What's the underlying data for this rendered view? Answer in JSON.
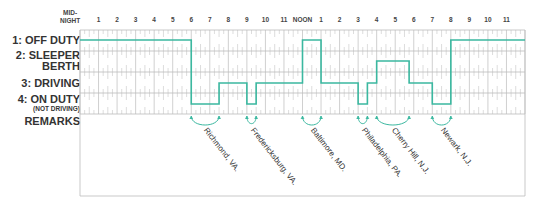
{
  "header": {
    "midnight_label": [
      "MID-",
      "NIGHT"
    ],
    "hour_labels": [
      {
        "hour": 1,
        "label": "1"
      },
      {
        "hour": 2,
        "label": "2"
      },
      {
        "hour": 3,
        "label": "3"
      },
      {
        "hour": 4,
        "label": "4"
      },
      {
        "hour": 5,
        "label": "5"
      },
      {
        "hour": 6,
        "label": "6"
      },
      {
        "hour": 7,
        "label": "7"
      },
      {
        "hour": 8,
        "label": "8"
      },
      {
        "hour": 9,
        "label": "9"
      },
      {
        "hour": 10,
        "label": "10"
      },
      {
        "hour": 11,
        "label": "11"
      },
      {
        "hour": 12,
        "label": "NOON"
      },
      {
        "hour": 13,
        "label": "1"
      },
      {
        "hour": 14,
        "label": "2"
      },
      {
        "hour": 15,
        "label": "3"
      },
      {
        "hour": 16,
        "label": "4"
      },
      {
        "hour": 17,
        "label": "5"
      },
      {
        "hour": 18,
        "label": "6"
      },
      {
        "hour": 19,
        "label": "7"
      },
      {
        "hour": 20,
        "label": "8"
      },
      {
        "hour": 21,
        "label": "9"
      },
      {
        "hour": 22,
        "label": "10"
      },
      {
        "hour": 23,
        "label": "11"
      }
    ]
  },
  "rows": [
    {
      "id": "off_duty",
      "label": "1: OFF DUTY",
      "sub": ""
    },
    {
      "id": "sleeper",
      "label": "2:  SLEEPER",
      "label2": "BERTH",
      "sub": ""
    },
    {
      "id": "driving",
      "label": "3:    DRIVING",
      "sub": ""
    },
    {
      "id": "on_duty",
      "label": "4:   ON DUTY",
      "sub": "(NOT DRIVING)"
    }
  ],
  "remarks_label": "REMARKS",
  "colors": {
    "line": "#3bb8a0",
    "grid": "#bbbbbb",
    "text": "#333333"
  },
  "status_segments": [
    {
      "start": 0,
      "end": 6,
      "status": 1
    },
    {
      "start": 6,
      "end": 7.5,
      "status": 4
    },
    {
      "start": 7.5,
      "end": 9,
      "status": 3
    },
    {
      "start": 9,
      "end": 9.5,
      "status": 4
    },
    {
      "start": 9.5,
      "end": 12,
      "status": 3
    },
    {
      "start": 12,
      "end": 13,
      "status": 1
    },
    {
      "start": 13,
      "end": 15,
      "status": 3
    },
    {
      "start": 15,
      "end": 15.5,
      "status": 4
    },
    {
      "start": 15.5,
      "end": 16,
      "status": 3
    },
    {
      "start": 16,
      "end": 17.75,
      "status": 2
    },
    {
      "start": 17.75,
      "end": 19,
      "status": 3
    },
    {
      "start": 19,
      "end": 20,
      "status": 4
    },
    {
      "start": 20,
      "end": 24,
      "status": 1
    }
  ],
  "remarks": [
    {
      "text": "Richmond, VA.",
      "from": 6,
      "to": 7.5
    },
    {
      "text": "Fredericksburg, VA.",
      "from": 9,
      "to": 9.5
    },
    {
      "text": "Baltimore, MD.",
      "from": 12,
      "to": 13
    },
    {
      "text": "Philadelphia, PA.",
      "from": 15,
      "to": 15.5
    },
    {
      "text": "Cherry Hill, N.J.",
      "from": 16,
      "to": 17.75
    },
    {
      "text": "Newark, N.J.",
      "from": 19,
      "to": 20
    }
  ]
}
